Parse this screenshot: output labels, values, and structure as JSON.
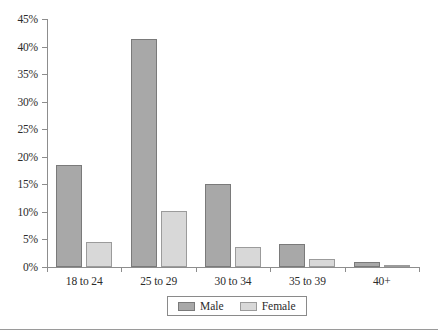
{
  "chart_data": {
    "type": "bar",
    "title": "",
    "xlabel": "",
    "ylabel": "",
    "categories": [
      "18 to 24",
      "25 to 29",
      "30 to 34",
      "35 to 39",
      "40+"
    ],
    "series": [
      {
        "name": "Male",
        "color": "#a8a8a8",
        "values": [
          18.5,
          41.3,
          15.0,
          4.1,
          1.0
        ]
      },
      {
        "name": "Female",
        "color": "#d8d8d8",
        "values": [
          4.6,
          10.1,
          3.6,
          1.4,
          0.4
        ]
      }
    ],
    "ylim": [
      0,
      45
    ],
    "ytick_values": [
      0,
      5,
      10,
      15,
      20,
      25,
      30,
      35,
      40,
      45
    ],
    "ytick_labels": [
      "0%",
      "5%",
      "10%",
      "15%",
      "20%",
      "25%",
      "30%",
      "35%",
      "40%",
      "45%"
    ],
    "grid": false,
    "legend_position": "bottom",
    "legend_entries": [
      "Male",
      "Female"
    ]
  }
}
